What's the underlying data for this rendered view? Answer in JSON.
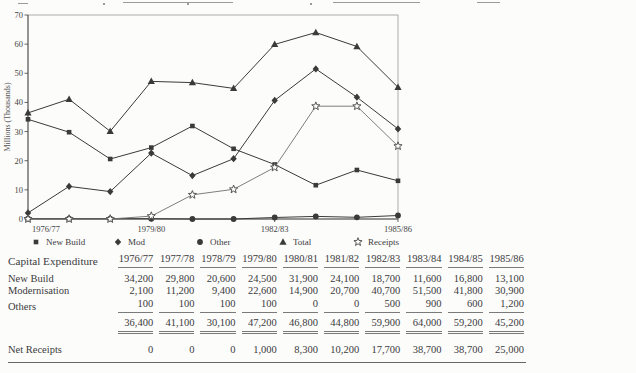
{
  "colors": {
    "ink": "#3a3a3a",
    "rule": "#7a7a7a",
    "background": "#fcfcfb",
    "receipts_line": "#6f6f6f"
  },
  "chart_data": {
    "type": "line",
    "title": "",
    "ylabel": "Millions (Thousands)",
    "xlabel": "",
    "ylim": [
      0,
      70
    ],
    "yticks": [
      0,
      10,
      20,
      30,
      40,
      50,
      60,
      70
    ],
    "categories": [
      "1976/77",
      "1977/78",
      "1978/79",
      "1979/80",
      "1980/81",
      "1981/82",
      "1982/83",
      "1983/84",
      "1984/85",
      "1985/86"
    ],
    "x_tick_labels": [
      "1976/77",
      "1979/80",
      "1982/83",
      "1985/86"
    ],
    "grid": false,
    "legend_position": "bottom",
    "series": [
      {
        "name": "New Build",
        "marker": "square",
        "values": [
          34.2,
          29.8,
          20.6,
          24.5,
          31.9,
          24.1,
          18.7,
          11.6,
          16.8,
          13.1
        ]
      },
      {
        "name": "Mod",
        "marker": "diamond",
        "values": [
          2.1,
          11.2,
          9.4,
          22.6,
          14.9,
          20.7,
          40.7,
          51.5,
          41.8,
          30.9
        ]
      },
      {
        "name": "Other",
        "marker": "circle",
        "values": [
          0.1,
          0.1,
          0.1,
          0.1,
          0,
          0,
          0.5,
          0.9,
          0.6,
          1.2
        ]
      },
      {
        "name": "Total",
        "marker": "triangle",
        "values": [
          36.4,
          41.1,
          30.1,
          47.2,
          46.8,
          44.8,
          59.9,
          64.0,
          59.2,
          45.2
        ]
      },
      {
        "name": "Receipts",
        "marker": "star",
        "values": [
          0,
          0,
          0,
          1.0,
          8.3,
          10.2,
          17.7,
          38.7,
          38.7,
          25.0
        ]
      }
    ]
  },
  "table": {
    "title_column": "Capital Expenditure",
    "years": [
      "1976/77",
      "1977/78",
      "1978/79",
      "1979/80",
      "1980/81",
      "1981/82",
      "1982/83",
      "1983/84",
      "1984/85",
      "1985/86"
    ],
    "rows": [
      {
        "label": "New Build",
        "values": [
          "34,200",
          "29,800",
          "20,600",
          "24,500",
          "31,900",
          "24,100",
          "18,700",
          "11,600",
          "16,800",
          "13,100"
        ]
      },
      {
        "label": "Modernisation",
        "values": [
          "2,100",
          "11,200",
          "9,400",
          "22,600",
          "14,900",
          "20,700",
          "40,700",
          "51,500",
          "41,800",
          "30,900"
        ]
      },
      {
        "label": "Others",
        "values": [
          "100",
          "100",
          "100",
          "100",
          "0",
          "0",
          "500",
          "900",
          "600",
          "1,200"
        ]
      }
    ],
    "total_row": {
      "label": "",
      "values": [
        "36,400",
        "41,100",
        "30,100",
        "47,200",
        "46,800",
        "44,800",
        "59,900",
        "64,000",
        "59,200",
        "45,200"
      ]
    },
    "net_row": {
      "label": "Net Receipts",
      "values": [
        "0",
        "0",
        "0",
        "1,000",
        "8,300",
        "10,200",
        "17,700",
        "38,700",
        "38,700",
        "25,000"
      ]
    }
  }
}
